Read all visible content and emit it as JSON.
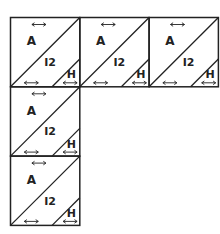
{
  "diagram": {
    "stroke_color": "#222222",
    "background": "#ffffff",
    "block_size": 69,
    "blocks": [
      {
        "id": "block-r1c1",
        "row": 0,
        "col": 0,
        "labels": {
          "large": "A",
          "middle": "I2",
          "small": "H"
        }
      },
      {
        "id": "block-r1c2",
        "row": 0,
        "col": 1,
        "labels": {
          "large": "A",
          "middle": "I2",
          "small": "H"
        }
      },
      {
        "id": "block-r1c3",
        "row": 0,
        "col": 2,
        "labels": {
          "large": "A",
          "middle": "I2",
          "small": "H"
        }
      },
      {
        "id": "block-r2c1",
        "row": 1,
        "col": 0,
        "labels": {
          "large": "A",
          "middle": "I2",
          "small": "H"
        }
      },
      {
        "id": "block-r3c1",
        "row": 2,
        "col": 0,
        "labels": {
          "large": "A",
          "middle": "I2",
          "small": "H"
        }
      }
    ],
    "grain_arrow_glyph": "↔"
  }
}
